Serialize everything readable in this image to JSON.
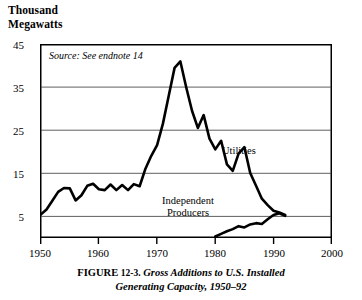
{
  "axis_unit_label": "Thousand\nMegawatts",
  "source_note": "Source: See endnote 14",
  "caption": {
    "prefix": "FIGURE",
    "number": "12-3.",
    "title_line1": "Gross Additions to U.S. Installed",
    "title_line2": "Generating Capacity, 1950–92"
  },
  "labels": {
    "utilities": "Utilities",
    "independent_line1": "Independent",
    "independent_line2": "Producers"
  },
  "colors": {
    "line": "#000000",
    "grid": "#555555",
    "frame": "#000000",
    "background": "#ffffff"
  },
  "chart_data": {
    "type": "line",
    "title": "Gross Additions to U.S. Installed Generating Capacity, 1950–92",
    "xlabel": "",
    "ylabel": "Thousand Megawatts",
    "xlim": [
      1950,
      2000
    ],
    "ylim": [
      0,
      45
    ],
    "yticks": [
      45,
      35,
      25,
      15,
      5
    ],
    "xticks": [
      1950,
      1960,
      1970,
      1980,
      1990,
      2000
    ],
    "grid": true,
    "legend": "inline-annotations",
    "annotations": [
      {
        "text": "Source: See endnote 14",
        "x": 1951.5,
        "y": 43
      },
      {
        "text": "Utilities",
        "x": 1987,
        "y": 19.5
      },
      {
        "text": "Independent Producers",
        "x": 1980.5,
        "y": 8.5
      }
    ],
    "series": [
      {
        "name": "Utilities",
        "x": [
          1950,
          1951,
          1952,
          1953,
          1954,
          1955,
          1956,
          1957,
          1958,
          1959,
          1960,
          1961,
          1962,
          1963,
          1964,
          1965,
          1966,
          1967,
          1968,
          1969,
          1970,
          1971,
          1972,
          1973,
          1974,
          1975,
          1976,
          1977,
          1978,
          1979,
          1980,
          1981,
          1982,
          1983,
          1984,
          1985,
          1986,
          1987,
          1988,
          1989,
          1990,
          1991,
          1992
        ],
        "values": [
          5.3,
          6.5,
          8.5,
          10.6,
          11.5,
          11.4,
          8.6,
          9.8,
          12.0,
          12.5,
          11.2,
          11.0,
          12.3,
          11.0,
          12.2,
          11.0,
          12.4,
          11.9,
          16.0,
          19.0,
          21.5,
          26.5,
          33.0,
          39.5,
          41.0,
          35.0,
          29.5,
          25.5,
          28.5,
          23.0,
          20.5,
          22.5,
          17.0,
          15.5,
          19.5,
          21.0,
          15.0,
          12.0,
          9.0,
          7.5,
          6.2,
          5.8,
          5.2
        ]
      },
      {
        "name": "Independent Producers",
        "x": [
          1980,
          1981,
          1982,
          1983,
          1984,
          1985,
          1986,
          1987,
          1988,
          1989,
          1990,
          1991,
          1992
        ],
        "values": [
          0.2,
          0.8,
          1.4,
          1.9,
          2.6,
          2.3,
          3.0,
          3.3,
          3.1,
          4.2,
          5.2,
          5.6,
          5.0
        ]
      }
    ]
  }
}
